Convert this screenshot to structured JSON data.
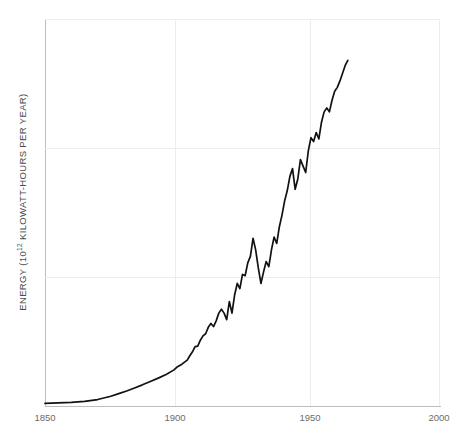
{
  "chart_data": {
    "type": "line",
    "title": "",
    "xlabel": "",
    "ylabel": "ENERGY (10¹² KILOWATT-HOURS PER YEAR)",
    "ylabel_prefix": "ENERGY (10",
    "ylabel_exponent": "12",
    "ylabel_suffix": " KILOWATT-HOURS PER YEAR)",
    "xlim": [
      1850,
      2000
    ],
    "ylim": [
      0,
      15
    ],
    "xticks": [
      1850,
      1900,
      1950,
      2000
    ],
    "xtick_labels": [
      "1850",
      "1900",
      "1950",
      "2000"
    ],
    "yticks": [
      0,
      5,
      10,
      15
    ],
    "ytick_labels": [
      "0",
      "5",
      "10",
      "15"
    ],
    "grid": true,
    "legend": "none",
    "line_color": "#111111",
    "grid_color": "#ededed",
    "axis_color": "#bdbdbd",
    "tick_label_color": "#6b6b6b",
    "background_color": "#ffffff",
    "series": [
      {
        "name": "World energy consumption",
        "x": [
          1850,
          1855,
          1860,
          1865,
          1870,
          1875,
          1878,
          1881,
          1884,
          1887,
          1890,
          1893,
          1896,
          1899,
          1900,
          1902,
          1904,
          1905,
          1906,
          1907,
          1908,
          1909,
          1910,
          1911,
          1912,
          1913,
          1914,
          1915,
          1916,
          1917,
          1918,
          1919,
          1920,
          1921,
          1922,
          1923,
          1924,
          1925,
          1926,
          1927,
          1928,
          1929,
          1930,
          1931,
          1932,
          1933,
          1934,
          1935,
          1936,
          1937,
          1938,
          1939,
          1940,
          1941,
          1942,
          1943,
          1944,
          1945,
          1946,
          1947,
          1948,
          1949,
          1950,
          1951,
          1952,
          1953,
          1954,
          1955,
          1956,
          1957,
          1958,
          1959,
          1960,
          1961,
          1962,
          1963,
          1964,
          1965
        ],
        "y": [
          0.1,
          0.12,
          0.14,
          0.18,
          0.25,
          0.38,
          0.48,
          0.58,
          0.7,
          0.82,
          0.95,
          1.08,
          1.22,
          1.4,
          1.5,
          1.62,
          1.78,
          1.95,
          2.1,
          2.3,
          2.32,
          2.55,
          2.72,
          2.8,
          3.05,
          3.2,
          3.08,
          3.3,
          3.6,
          3.75,
          3.6,
          3.35,
          4.05,
          3.6,
          4.3,
          4.75,
          4.55,
          5.1,
          5.05,
          5.55,
          5.8,
          6.5,
          6.05,
          5.35,
          4.75,
          5.2,
          5.6,
          5.4,
          6.05,
          6.55,
          6.3,
          6.95,
          7.4,
          7.95,
          8.35,
          8.9,
          9.2,
          8.4,
          8.8,
          9.55,
          9.3,
          9.05,
          9.9,
          10.4,
          10.25,
          10.6,
          10.35,
          11.0,
          11.4,
          11.55,
          11.4,
          11.85,
          12.2,
          12.35,
          12.6,
          12.9,
          13.2,
          13.4
        ]
      }
    ]
  }
}
